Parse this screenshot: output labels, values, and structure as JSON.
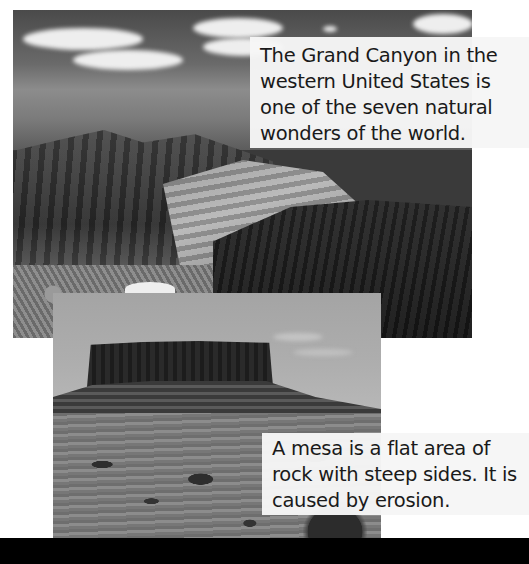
{
  "photos": [
    {
      "subject": "Grand Canyon",
      "style": "black-and-white landscape photograph"
    },
    {
      "subject": "mesa",
      "style": "black-and-white landscape photograph"
    }
  ],
  "captions": {
    "canyon": "The Grand Canyon in the western United States is one of the seven natural wonders of the world.",
    "mesa": "A mesa is a flat area of rock with steep sides. It is caused by erosion."
  },
  "colors": {
    "background": "#ffffff",
    "caption_bg": "#f6f6f6",
    "caption_text": "#1a1a1a",
    "band": "#000000"
  }
}
